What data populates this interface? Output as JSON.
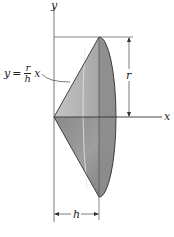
{
  "figure": {
    "type": "cone-of-revolution",
    "axes": {
      "y_label": "y",
      "x_label": "x"
    },
    "equation": {
      "lhs": "y",
      "equals": "=",
      "numerator": "r",
      "denominator": "h",
      "variable": "x"
    },
    "dimensions": {
      "radius_label": "r",
      "height_label": "h"
    },
    "colors": {
      "cone_light": "#b9b9b9",
      "cone_mid": "#9a9a9a",
      "cone_dark": "#7d7d7d",
      "base_face": "#8f8f8f",
      "outline": "#333333",
      "axis": "#555555"
    }
  }
}
